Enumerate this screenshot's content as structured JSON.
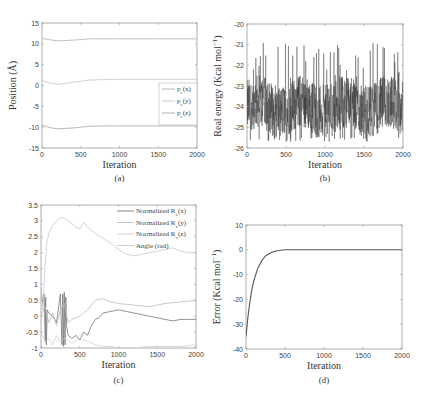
{
  "chart_data": [
    {
      "id": "a",
      "type": "line",
      "caption": "(a)",
      "xlabel": "Iteration",
      "ylabel": "Position (Å)",
      "xlim": [
        0,
        2000
      ],
      "ylim": [
        -15,
        15
      ],
      "xticks": [
        0,
        500,
        1000,
        1500,
        2000
      ],
      "yticks": [
        -15,
        -10,
        -5,
        0,
        5,
        10,
        15
      ],
      "legend": {
        "position": "center right",
        "entries": [
          "p_e(x)",
          "p_e(y)",
          "p_e(z)"
        ]
      },
      "grid": false,
      "series": [
        {
          "name": "p_e(x)",
          "color": "#b0b0b0",
          "x": [
            0,
            100,
            200,
            300,
            400,
            500,
            600,
            800,
            1000,
            1500,
            2000
          ],
          "y": [
            11.3,
            11.0,
            10.7,
            10.8,
            10.9,
            11.0,
            11.2,
            11.2,
            11.2,
            11.2,
            11.2
          ]
        },
        {
          "name": "p_e(y)",
          "color": "#c4c4c4",
          "x": [
            0,
            100,
            200,
            300,
            400,
            500,
            600,
            800,
            1000,
            1500,
            2000
          ],
          "y": [
            1.2,
            0.6,
            0.3,
            0.5,
            0.8,
            1.0,
            1.3,
            1.4,
            1.5,
            1.5,
            1.5
          ]
        },
        {
          "name": "p_e(z)",
          "color": "#a8a8a8",
          "x": [
            0,
            100,
            200,
            300,
            400,
            500,
            600,
            800,
            1000,
            1500,
            2000
          ],
          "y": [
            -9.6,
            -10.1,
            -10.4,
            -10.3,
            -10.2,
            -10.0,
            -9.8,
            -9.7,
            -9.7,
            -9.7,
            -9.7
          ]
        }
      ]
    },
    {
      "id": "b",
      "type": "line",
      "caption": "(b)",
      "xlabel": "Iteration",
      "ylabel": "Real energy (Kcal mol⁻¹)",
      "xlim": [
        0,
        2000
      ],
      "ylim": [
        -26,
        -20
      ],
      "xticks": [
        0,
        500,
        1000,
        1500,
        2000
      ],
      "yticks": [
        -26,
        -25,
        -24,
        -23,
        -22,
        -21,
        -20
      ],
      "grid": false,
      "series": [
        {
          "name": "real energy",
          "color": "#333333",
          "noisy": true,
          "mean": -24.0,
          "band_low": -25.5,
          "band_high": -22.5,
          "spikes_max": [
            -20.8,
            -21.2,
            -21.3,
            -21.2,
            -21.5
          ],
          "points": 2000
        }
      ]
    },
    {
      "id": "c",
      "type": "line",
      "caption": "(c)",
      "xlabel": "Iteration",
      "ylabel": "",
      "xlim": [
        0,
        2000
      ],
      "ylim": [
        -1,
        3.5
      ],
      "xticks": [
        0,
        500,
        1000,
        1500,
        2000
      ],
      "yticks": [
        -1,
        -0.5,
        0,
        0.5,
        1,
        1.5,
        2,
        2.5,
        3,
        3.5
      ],
      "legend": {
        "position": "upper right",
        "entries": [
          "Normalized R_v(x)",
          "Normalized R_v(y)",
          "Normalized R_v(z)",
          "Angle (rad)"
        ]
      },
      "grid": false,
      "series": [
        {
          "name": "Normalized R_v(x)",
          "color": "#777777",
          "x": [
            0,
            20,
            40,
            55,
            60,
            70,
            80,
            100,
            150,
            200,
            250,
            270,
            280,
            290,
            300,
            310,
            320,
            330,
            350,
            400,
            450,
            500,
            550,
            600,
            650,
            700,
            750,
            800,
            900,
            1000,
            1100,
            1200,
            1300,
            1400,
            1500,
            1600,
            1700,
            1800,
            1900,
            2000
          ],
          "y": [
            0.9,
            0.4,
            0.7,
            -0.8,
            0.6,
            -0.9,
            0.2,
            0.1,
            0.0,
            -0.2,
            0.7,
            -0.9,
            0.7,
            -0.95,
            0.75,
            -0.9,
            0.6,
            -0.3,
            -0.6,
            -0.7,
            -0.6,
            -0.75,
            -0.5,
            -0.6,
            -0.3,
            -0.1,
            -0.05,
            0.1,
            0.15,
            0.2,
            0.15,
            0.1,
            0.05,
            0.0,
            -0.05,
            -0.1,
            -0.15,
            -0.1,
            -0.1,
            -0.1
          ]
        },
        {
          "name": "Normalized R_v(y)",
          "color": "#bdbdbd",
          "x": [
            0,
            50,
            100,
            150,
            200,
            250,
            300,
            350,
            400,
            500,
            600,
            700,
            800,
            900,
            1000,
            1200,
            1400,
            1600,
            1800,
            2000
          ],
          "y": [
            0.0,
            0.3,
            -0.2,
            0.1,
            -0.3,
            0.2,
            0.4,
            -0.2,
            -0.1,
            0.0,
            0.2,
            0.5,
            0.55,
            0.45,
            0.4,
            0.35,
            0.3,
            0.4,
            0.45,
            0.5
          ]
        },
        {
          "name": "Normalized R_v(z)",
          "color": "#cfcfcf",
          "x": [
            0,
            50,
            100,
            150,
            200,
            250,
            300,
            400,
            500,
            600,
            700,
            800,
            900,
            1000,
            1200,
            1400,
            1600,
            1800,
            2000
          ],
          "y": [
            -0.5,
            -0.8,
            -0.7,
            -0.9,
            -0.6,
            -0.8,
            -0.7,
            -0.85,
            -0.7,
            -0.8,
            -0.9,
            -0.95,
            -0.95,
            -1.0,
            -1.0,
            -0.95,
            -0.95,
            -0.95,
            -0.9
          ]
        },
        {
          "name": "Angle (rad)",
          "color": "#c8c8c8",
          "x": [
            0,
            25,
            50,
            75,
            100,
            150,
            200,
            250,
            300,
            350,
            400,
            450,
            500,
            550,
            600,
            650,
            700,
            800,
            900,
            1000,
            1100,
            1200,
            1300,
            1400,
            1500,
            1600,
            1700,
            1800,
            1900,
            2000
          ],
          "y": [
            0.9,
            0.2,
            1.5,
            2.3,
            2.6,
            2.85,
            3.0,
            3.1,
            3.1,
            3.0,
            2.9,
            2.8,
            2.75,
            2.95,
            2.8,
            2.7,
            2.6,
            2.45,
            2.3,
            2.1,
            1.95,
            1.9,
            1.95,
            2.0,
            2.05,
            2.1,
            2.15,
            2.05,
            2.0,
            2.0
          ]
        }
      ]
    },
    {
      "id": "d",
      "type": "line",
      "caption": "(d)",
      "xlabel": "Iteration",
      "ylabel": "Error (Kcal mol⁻¹)",
      "xlim": [
        0,
        2000
      ],
      "ylim": [
        -40,
        10
      ],
      "xticks": [
        0,
        500,
        1000,
        1500,
        2000
      ],
      "yticks": [
        -40,
        -30,
        -20,
        -10,
        0,
        10
      ],
      "grid": false,
      "series": [
        {
          "name": "error",
          "color": "#555555",
          "x": [
            0,
            25,
            50,
            75,
            100,
            150,
            200,
            250,
            300,
            350,
            400,
            450,
            500,
            600,
            800,
            1000,
            1500,
            2000
          ],
          "y": [
            -35,
            -27,
            -21,
            -16,
            -12.5,
            -7.5,
            -4.5,
            -2.5,
            -1.5,
            -0.8,
            -0.4,
            -0.2,
            0,
            0,
            0,
            0,
            0,
            0
          ]
        }
      ]
    }
  ],
  "layout": {
    "panels": {
      "a": {
        "left": 42,
        "top": 23,
        "right": 197,
        "bottom": 148,
        "caption_y": 181
      },
      "b": {
        "left": 247,
        "top": 24,
        "right": 403,
        "bottom": 148,
        "caption_y": 181
      },
      "c": {
        "left": 41,
        "top": 205,
        "right": 196,
        "bottom": 348,
        "caption_y": 383
      },
      "d": {
        "left": 246,
        "top": 225,
        "right": 402,
        "bottom": 349,
        "caption_y": 383
      }
    }
  }
}
